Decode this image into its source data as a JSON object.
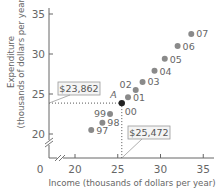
{
  "chart_data": {
    "type": "scatter",
    "title": "",
    "xlabel": "Income (thousands of dollars per year)",
    "ylabel_line1": "Expenditure",
    "ylabel_line2": "(thousands of dollars per year)",
    "xlim": [
      20,
      36
    ],
    "ylim": [
      19,
      36
    ],
    "x_ticks": [
      20,
      25,
      30,
      35
    ],
    "y_ticks": [
      20,
      25,
      30,
      35
    ],
    "origin_label": "0",
    "axis_breaks": true,
    "grid": false,
    "points": [
      {
        "label": "97",
        "x": 21.9,
        "y": 20.5
      },
      {
        "label": "98",
        "x": 23.2,
        "y": 21.4
      },
      {
        "label": "99",
        "x": 24.1,
        "y": 22.5
      },
      {
        "label": "00",
        "x": 25.472,
        "y": 23.862,
        "highlight": true,
        "marker_label": "A"
      },
      {
        "label": "01",
        "x": 26.2,
        "y": 24.6
      },
      {
        "label": "02",
        "x": 27.1,
        "y": 25.5
      },
      {
        "label": "03",
        "x": 27.9,
        "y": 26.5
      },
      {
        "label": "04",
        "x": 29.3,
        "y": 27.9
      },
      {
        "label": "05",
        "x": 30.5,
        "y": 29.4
      },
      {
        "label": "06",
        "x": 32.0,
        "y": 31.0
      },
      {
        "label": "07",
        "x": 33.6,
        "y": 32.5
      }
    ],
    "annotations": [
      {
        "text": "$23,862",
        "axis": "y",
        "value": 23.862
      },
      {
        "text": "$25,472",
        "axis": "x",
        "value": 25.472
      }
    ],
    "colors": {
      "point": "#8a8a8a",
      "highlight": "#222222",
      "axis": "#666666"
    }
  }
}
